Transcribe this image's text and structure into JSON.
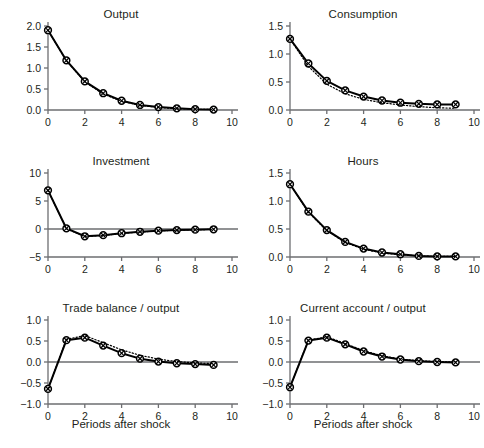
{
  "figure": {
    "background": "#ffffff",
    "line_color": "#000000",
    "axis_color": "#6d6e71",
    "marker_fill": "#ffffff",
    "xlabel": "Periods after shock",
    "xlabel_panels": [
      "trade_balance",
      "current_account"
    ]
  },
  "chart_data": [
    {
      "type": "line",
      "title": "Output",
      "xlabel": "",
      "ylabel": "",
      "xlim": [
        0,
        10
      ],
      "ylim": [
        0.0,
        2.0
      ],
      "xticks": [
        0,
        2,
        4,
        6,
        8,
        10
      ],
      "xtick_labels": [
        "0",
        "2",
        "4",
        "6",
        "8",
        "10"
      ],
      "yticks": [
        0.0,
        0.5,
        1.0,
        1.5,
        2.0
      ],
      "ytick_labels": [
        "0.0",
        "0.5",
        "1.0",
        "1.5",
        "2.0"
      ],
      "grid": false,
      "legend": "none",
      "x": [
        0,
        1,
        2,
        3,
        4,
        5,
        6,
        7,
        8,
        9
      ],
      "series": [
        {
          "name": "solid",
          "style": "solid",
          "marker": "circle-cross",
          "values": [
            1.9,
            1.18,
            0.68,
            0.4,
            0.22,
            0.12,
            0.07,
            0.04,
            0.02,
            0.01
          ]
        },
        {
          "name": "dotted",
          "style": "dotted",
          "marker": "none",
          "values": [
            1.9,
            1.17,
            0.67,
            0.38,
            0.21,
            0.11,
            0.06,
            0.03,
            0.02,
            0.01
          ]
        }
      ]
    },
    {
      "type": "line",
      "title": "Consumption",
      "xlabel": "",
      "ylabel": "",
      "xlim": [
        0,
        10
      ],
      "ylim": [
        0.0,
        1.5
      ],
      "xticks": [
        0,
        2,
        4,
        6,
        8,
        10
      ],
      "xtick_labels": [
        "0",
        "2",
        "4",
        "6",
        "8",
        "10"
      ],
      "yticks": [
        0.0,
        0.5,
        1.0,
        1.5
      ],
      "ytick_labels": [
        "0.0",
        "0.5",
        "1.0",
        "1.5"
      ],
      "grid": false,
      "legend": "none",
      "x": [
        0,
        1,
        2,
        3,
        4,
        5,
        6,
        7,
        8,
        9
      ],
      "series": [
        {
          "name": "solid",
          "style": "solid",
          "marker": "circle-cross",
          "values": [
            1.27,
            0.83,
            0.52,
            0.35,
            0.24,
            0.17,
            0.13,
            0.11,
            0.1,
            0.1
          ]
        },
        {
          "name": "dotted",
          "style": "dotted",
          "marker": "none",
          "values": [
            1.27,
            0.78,
            0.46,
            0.29,
            0.19,
            0.13,
            0.09,
            0.06,
            0.04,
            0.03
          ]
        }
      ]
    },
    {
      "type": "line",
      "title": "Investment",
      "xlabel": "",
      "ylabel": "",
      "xlim": [
        0,
        10
      ],
      "ylim": [
        -5,
        10
      ],
      "xticks": [
        0,
        2,
        4,
        6,
        8,
        10
      ],
      "xtick_labels": [
        "0",
        "2",
        "4",
        "6",
        "8",
        "10"
      ],
      "yticks": [
        -5,
        0,
        5,
        10
      ],
      "ytick_labels": [
        "−5",
        "0",
        "5",
        "10"
      ],
      "grid": false,
      "legend": "none",
      "x": [
        0,
        1,
        2,
        3,
        4,
        5,
        6,
        7,
        8,
        9
      ],
      "series": [
        {
          "name": "solid",
          "style": "solid",
          "marker": "circle-cross",
          "values": [
            6.9,
            0.1,
            -1.3,
            -1.1,
            -0.75,
            -0.5,
            -0.3,
            -0.2,
            -0.12,
            -0.05
          ]
        },
        {
          "name": "dotted",
          "style": "dotted",
          "marker": "none",
          "values": [
            6.9,
            0.05,
            -1.35,
            -1.15,
            -0.8,
            -0.55,
            -0.33,
            -0.22,
            -0.13,
            -0.06
          ]
        }
      ]
    },
    {
      "type": "line",
      "title": "Hours",
      "xlabel": "",
      "ylabel": "",
      "xlim": [
        0,
        10
      ],
      "ylim": [
        0.0,
        1.5
      ],
      "xticks": [
        0,
        2,
        4,
        6,
        8,
        10
      ],
      "xtick_labels": [
        "0",
        "2",
        "4",
        "6",
        "8",
        "10"
      ],
      "yticks": [
        0.0,
        0.5,
        1.0,
        1.5
      ],
      "ytick_labels": [
        "0.0",
        "0.5",
        "1.0",
        "1.5"
      ],
      "grid": false,
      "legend": "none",
      "x": [
        0,
        1,
        2,
        3,
        4,
        5,
        6,
        7,
        8,
        9
      ],
      "series": [
        {
          "name": "solid",
          "style": "solid",
          "marker": "circle-cross",
          "values": [
            1.3,
            0.81,
            0.48,
            0.27,
            0.15,
            0.08,
            0.05,
            0.02,
            0.01,
            0.01
          ]
        },
        {
          "name": "dotted",
          "style": "dotted",
          "marker": "none",
          "values": [
            1.3,
            0.8,
            0.47,
            0.26,
            0.14,
            0.07,
            0.04,
            0.02,
            0.01,
            0.01
          ]
        }
      ]
    },
    {
      "type": "line",
      "title": "Trade balance / output",
      "xlabel": "Periods after shock",
      "ylabel": "",
      "xlim": [
        0,
        10
      ],
      "ylim": [
        -1.0,
        1.0
      ],
      "xticks": [
        0,
        2,
        4,
        6,
        8,
        10
      ],
      "xtick_labels": [
        "0",
        "2",
        "4",
        "6",
        "8",
        "10"
      ],
      "yticks": [
        -1.0,
        -0.5,
        0.0,
        0.5,
        1.0
      ],
      "ytick_labels": [
        "−1.0",
        "−0.5",
        "0.0",
        "0.5",
        "1.0"
      ],
      "grid": false,
      "legend": "none",
      "x": [
        0,
        1,
        2,
        3,
        4,
        5,
        6,
        7,
        8,
        9
      ],
      "series": [
        {
          "name": "solid",
          "style": "solid",
          "marker": "circle-cross",
          "values": [
            -0.64,
            0.52,
            0.58,
            0.39,
            0.21,
            0.08,
            0.01,
            -0.03,
            -0.05,
            -0.07
          ]
        },
        {
          "name": "dotted",
          "style": "dotted",
          "marker": "none",
          "values": [
            -0.64,
            0.54,
            0.63,
            0.46,
            0.29,
            0.16,
            0.07,
            0.01,
            -0.02,
            -0.04
          ]
        }
      ]
    },
    {
      "type": "line",
      "title": "Current account / output",
      "xlabel": "Periods after shock",
      "ylabel": "",
      "xlim": [
        0,
        10
      ],
      "ylim": [
        -1.0,
        1.0
      ],
      "xticks": [
        0,
        2,
        4,
        6,
        8,
        10
      ],
      "xtick_labels": [
        "0",
        "2",
        "4",
        "6",
        "8",
        "10"
      ],
      "yticks": [
        -1.0,
        -0.5,
        0.0,
        0.5,
        1.0
      ],
      "ytick_labels": [
        "−1.0",
        "−0.5",
        "0.0",
        "0.5",
        "1.0"
      ],
      "grid": false,
      "legend": "none",
      "x": [
        0,
        1,
        2,
        3,
        4,
        5,
        6,
        7,
        8,
        9
      ],
      "series": [
        {
          "name": "solid",
          "style": "solid",
          "marker": "circle-cross",
          "values": [
            -0.6,
            0.51,
            0.58,
            0.42,
            0.25,
            0.13,
            0.06,
            0.02,
            0.0,
            -0.01
          ]
        },
        {
          "name": "dotted",
          "style": "dotted",
          "marker": "none",
          "values": [
            -0.6,
            0.52,
            0.6,
            0.44,
            0.27,
            0.15,
            0.07,
            0.03,
            0.01,
            0.0
          ]
        }
      ]
    }
  ]
}
